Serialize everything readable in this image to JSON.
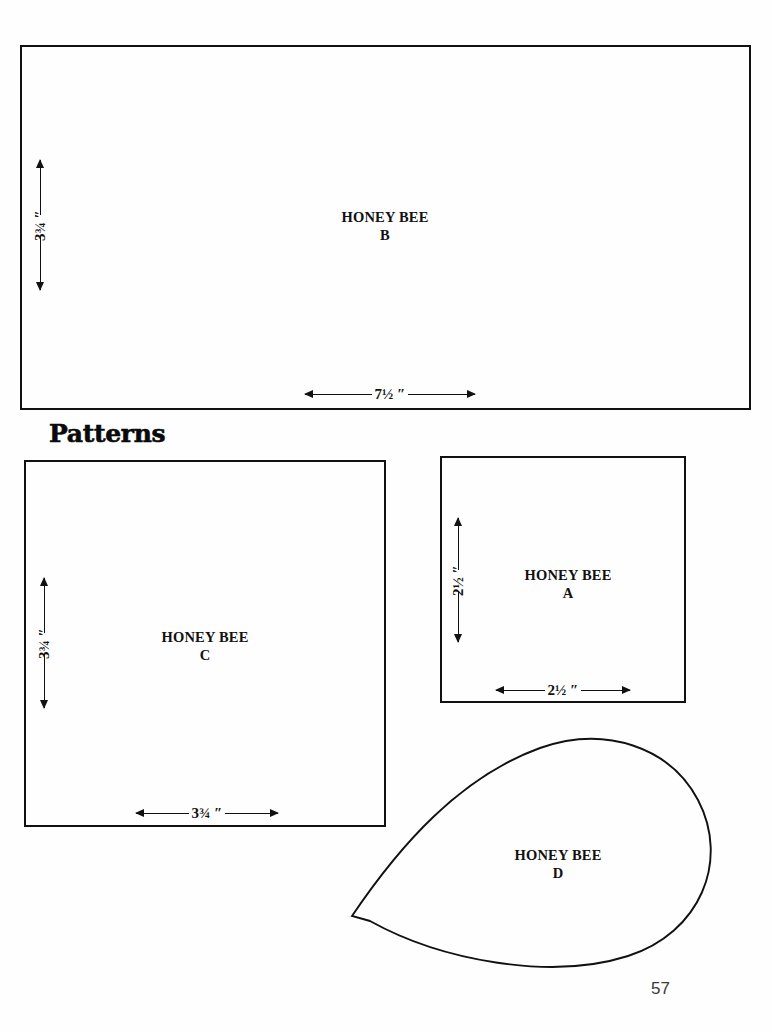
{
  "document": {
    "page_number": "57",
    "section_heading": "Patterns",
    "background_color": "#fefefe",
    "ink_color": "#111111"
  },
  "pattern_pieces": [
    {
      "id": "B",
      "name_line1": "HONEY BEE",
      "name_line2": "B",
      "shape": "rectangle",
      "width_label": "7½ ″",
      "height_label": "3¾ ″",
      "width_inches": 7.5,
      "height_inches": 3.75
    },
    {
      "id": "C",
      "name_line1": "HONEY BEE",
      "name_line2": "C",
      "shape": "square",
      "width_label": "3¾ ″",
      "height_label": "3¾ ″",
      "width_inches": 3.75,
      "height_inches": 3.75
    },
    {
      "id": "A",
      "name_line1": "HONEY BEE",
      "name_line2": "A",
      "shape": "square",
      "width_label": "2½ ″",
      "height_label": "2½ ″",
      "width_inches": 2.5,
      "height_inches": 2.5
    },
    {
      "id": "D",
      "name_line1": "HONEY BEE",
      "name_line2": "D",
      "shape": "teardrop",
      "width_label": "",
      "height_label": ""
    }
  ]
}
